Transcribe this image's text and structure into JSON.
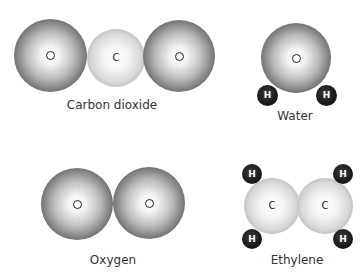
{
  "molecules": [
    {
      "name": "Carbon dioxide",
      "atoms": [
        "O",
        "C",
        "O"
      ]
    },
    {
      "name": "Water",
      "atoms": [
        "O",
        "H",
        "H"
      ]
    },
    {
      "name": "Oxygen",
      "atoms": [
        "O",
        "O"
      ]
    },
    {
      "name": "Ethylene",
      "atoms": [
        "C",
        "C",
        "H",
        "H",
        "H",
        "H"
      ]
    }
  ],
  "symbols": {
    "oxygen": "O",
    "carbon": "C",
    "hydrogen": "H"
  }
}
